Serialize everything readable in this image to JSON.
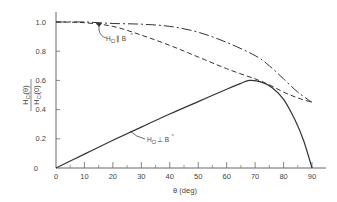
{
  "chart_data": {
    "type": "line",
    "title": "",
    "xlabel": "θ (deg)",
    "ylabel": "H_Cl(θ) / H_Cl(0)",
    "xlim": [
      0,
      90
    ],
    "ylim": [
      0,
      1.0
    ],
    "grid": false,
    "x_ticks": [
      0,
      10,
      20,
      30,
      40,
      50,
      60,
      70,
      80,
      90
    ],
    "y_ticks": [
      0,
      0.2,
      0.4,
      0.6,
      0.8,
      1.0
    ],
    "x_tick_labels": [
      "0",
      "10",
      "20",
      "30",
      "40",
      "50",
      "60",
      "70",
      "80",
      "90"
    ],
    "y_tick_labels": [
      "0",
      "0.2",
      "0.4",
      "0.6",
      "0.8",
      "1.0"
    ],
    "x": [
      0,
      10,
      20,
      30,
      40,
      50,
      60,
      70,
      80,
      90
    ],
    "series": [
      {
        "name": "dash-dot curve (upper)",
        "style": "dash-dot",
        "x": [
          0,
          10,
          20,
          30,
          40,
          50,
          60,
          70,
          75,
          80,
          85,
          90
        ],
        "values": [
          1.0,
          1.0,
          0.99,
          0.985,
          0.97,
          0.93,
          0.86,
          0.77,
          0.7,
          0.61,
          0.52,
          0.45
        ]
      },
      {
        "name": "H_Cl ∥ B",
        "style": "dashed",
        "x": [
          0,
          10,
          20,
          30,
          40,
          50,
          60,
          70,
          75,
          80,
          85,
          90
        ],
        "values": [
          1.0,
          0.995,
          0.97,
          0.91,
          0.84,
          0.76,
          0.68,
          0.61,
          0.57,
          0.52,
          0.48,
          0.45
        ]
      },
      {
        "name": "H_Cl ⊥ B",
        "style": "solid",
        "x": [
          0,
          10,
          20,
          30,
          40,
          50,
          60,
          65,
          68,
          72,
          76,
          80,
          84,
          87,
          90
        ],
        "values": [
          0.0,
          0.095,
          0.19,
          0.28,
          0.37,
          0.455,
          0.54,
          0.58,
          0.6,
          0.59,
          0.55,
          0.47,
          0.33,
          0.19,
          0.0
        ]
      }
    ],
    "annotations": [
      {
        "text": "H_Cl ∥ B⃗",
        "points_to": "H_Cl ∥ B curve",
        "near_x": 15,
        "near_y": 0.99
      },
      {
        "text": "H_Cl ⊥ B⃗",
        "points_to": "H_Cl ⊥ B curve",
        "near_x": 25,
        "near_y": 0.24
      }
    ]
  },
  "labels": {
    "ylabel_num": "H",
    "ylabel_num_sub": "Cl",
    "ylabel_num_arg": "(θ)",
    "ylabel_den": "H",
    "ylabel_den_sub": "Cl",
    "ylabel_den_arg": "(0)",
    "xlabel": "θ   (deg)",
    "annot_par_main": "H",
    "annot_par_sub": "Cl",
    "annot_par_rel": "∥ B",
    "annot_perp_main": "H",
    "annot_perp_sub": "Cl",
    "annot_perp_rel": "⊥ B"
  }
}
